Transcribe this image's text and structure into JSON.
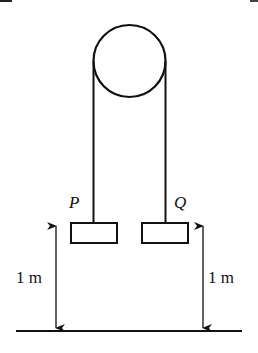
{
  "diagram": {
    "type": "pulley-system",
    "pulley": {
      "shape": "circle"
    },
    "masses": [
      {
        "label": "P",
        "height_above_ground": "1 m"
      },
      {
        "label": "Q",
        "height_above_ground": "1 m"
      }
    ],
    "dimension_labels": {
      "left": "1 m",
      "right": "1 m"
    },
    "colors": {
      "stroke": "#111111",
      "background": "#ffffff"
    }
  }
}
